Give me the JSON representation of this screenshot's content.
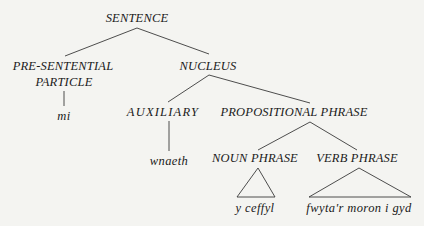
{
  "diagram": {
    "type": "syntax-tree",
    "nodes": {
      "sentence": "SENTENCE",
      "pre_sentential_line1": "PRE-SENTENTIAL",
      "pre_sentential_line2": "PARTICLE",
      "nucleus": "NUCLEUS",
      "auxiliary": "AUXILIARY",
      "propositional_phrase": "PROPOSITIONAL PHRASE",
      "noun_phrase": "NOUN PHRASE",
      "verb_phrase": "VERB PHRASE"
    },
    "leaves": {
      "particle_word": "mi",
      "auxiliary_word": "wnaeth",
      "noun_phrase_words": "y ceffyl",
      "verb_phrase_words": "fwyta'r moron i gyd"
    },
    "edges": [
      {
        "from": "SENTENCE",
        "to": "PRE-SENTENTIAL PARTICLE"
      },
      {
        "from": "SENTENCE",
        "to": "NUCLEUS"
      },
      {
        "from": "PRE-SENTENTIAL PARTICLE",
        "to": "mi"
      },
      {
        "from": "NUCLEUS",
        "to": "AUXILIARY"
      },
      {
        "from": "NUCLEUS",
        "to": "PROPOSITIONAL PHRASE"
      },
      {
        "from": "AUXILIARY",
        "to": "wnaeth"
      },
      {
        "from": "PROPOSITIONAL PHRASE",
        "to": "NOUN PHRASE"
      },
      {
        "from": "PROPOSITIONAL PHRASE",
        "to": "VERB PHRASE"
      },
      {
        "from": "NOUN PHRASE",
        "to": "y ceffyl",
        "style": "triangle"
      },
      {
        "from": "VERB PHRASE",
        "to": "fwyta'r moron i gyd",
        "style": "triangle"
      }
    ]
  }
}
